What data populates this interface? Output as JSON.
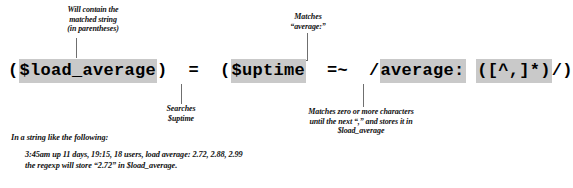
{
  "figure": {
    "kind": "annotated-code-diagram",
    "accent_highlight_color": "#c9c9c9",
    "leader_line_color": "#6f6f6f"
  },
  "code": {
    "tokens": [
      {
        "text": "(",
        "highlight": false
      },
      {
        "text": "$load_average",
        "highlight": true
      },
      {
        "text": ")  =  (",
        "highlight": false
      },
      {
        "text": "$uptime",
        "highlight": true
      },
      {
        "text": "  =~  /",
        "highlight": false
      },
      {
        "text": "average:",
        "highlight": true
      },
      {
        "text": " ",
        "highlight": false
      },
      {
        "text": "([^,]*)",
        "highlight": true
      },
      {
        "text": "/)",
        "highlight": false
      }
    ]
  },
  "callouts": {
    "load_average": {
      "lines": [
        "Will contain the",
        "matched string",
        "(in parentheses)"
      ]
    },
    "average_literal": {
      "lines": [
        "Matches",
        "“average:”"
      ]
    },
    "uptime": {
      "lines": [
        "Searches",
        "$uptime"
      ]
    },
    "capture_group": {
      "lines": [
        "Matches zero or more characters",
        "until the next “,” and stores it in",
        "$load_average"
      ]
    }
  },
  "footnote": {
    "intro": "In a string like the following:",
    "example": "3:45am  up 11 days, 19:15,  18 users,  load average: 2.72, 2.88, 2.99",
    "conclusion": "the regexp will store “2.72” in $load_average."
  }
}
